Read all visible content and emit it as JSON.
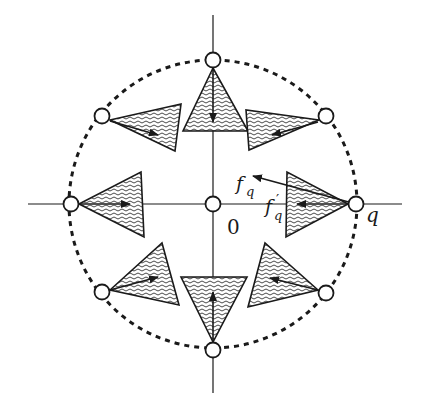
{
  "diagram": {
    "center": {
      "x": 213,
      "y": 204
    },
    "circle_radius": 144,
    "colors": {
      "stroke": "#1a1a1a",
      "background": "#ffffff",
      "hatch": "#333333"
    },
    "axes": {
      "horizontal": {
        "x1": 28,
        "x2": 402,
        "y": 204
      },
      "vertical": {
        "x": 213,
        "y1": 15,
        "y2": 393
      }
    },
    "labels": {
      "origin": "0",
      "q": "q",
      "f_q": "f",
      "f_q_sub": "q",
      "f_q_prime": "f",
      "f_q_prime_mark": "′",
      "f_q_prime_sub": "q"
    },
    "nodes": [
      {
        "name": "node-top",
        "x": 213,
        "y": 60
      },
      {
        "name": "node-upper-right",
        "x": 326,
        "y": 116
      },
      {
        "name": "node-right-q",
        "x": 356,
        "y": 204
      },
      {
        "name": "node-lower-right",
        "x": 326,
        "y": 293
      },
      {
        "name": "node-bottom",
        "x": 213,
        "y": 350
      },
      {
        "name": "node-lower-left",
        "x": 102,
        "y": 292
      },
      {
        "name": "node-left",
        "x": 71,
        "y": 204
      },
      {
        "name": "node-upper-left",
        "x": 102,
        "y": 116
      },
      {
        "name": "node-origin",
        "x": 213,
        "y": 204
      }
    ],
    "wedges": [
      {
        "name": "wedge-top",
        "points": "213,68 183,131 248,131",
        "arrow": [
          213,
          70,
          213,
          122
        ]
      },
      {
        "name": "wedge-upper-right",
        "points": "319,120 246,110 249,150",
        "arrow": [
          318,
          122,
          272,
          135
        ]
      },
      {
        "name": "wedge-right",
        "points": "348,204 287,172 286,237",
        "arrow": [
          348,
          204,
          297,
          204
        ]
      },
      {
        "name": "wedge-lower-right",
        "points": "318,290 265,243 248,307",
        "arrow": [
          318,
          290,
          270,
          278
        ]
      },
      {
        "name": "wedge-bottom",
        "points": "213,342 181,277 247,277",
        "arrow": [
          213,
          340,
          213,
          292
        ]
      },
      {
        "name": "wedge-lower-left",
        "points": "110,290 162,243 179,305",
        "arrow": [
          110,
          290,
          158,
          277
        ]
      },
      {
        "name": "wedge-left",
        "points": "79,204 141,172 144,237",
        "arrow": [
          79,
          204,
          130,
          204
        ]
      },
      {
        "name": "wedge-upper-left",
        "points": "110,120 181,104 175,151",
        "arrow": [
          110,
          121,
          158,
          135
        ]
      }
    ],
    "force_arrow_fq": [
      356,
      204,
      253,
      176
    ]
  }
}
